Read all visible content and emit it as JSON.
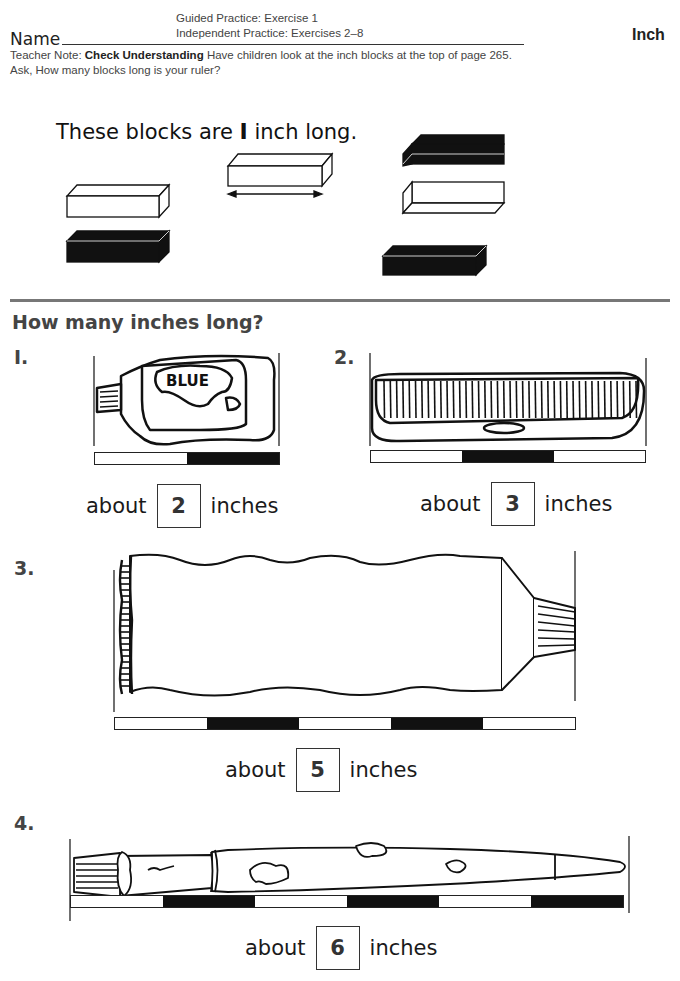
{
  "header": {
    "name_label": "Name",
    "guided_practice": "Guided Practice: Exercise 1",
    "independent_practice": "Independent Practice: Exercises 2–8",
    "topic": "Inch",
    "teacher_note_prefix": "Teacher Note:",
    "teacher_note_bold": "Check Understanding",
    "teacher_note_text": "Have children look at the inch blocks at the top of page 265. Ask, How many blocks long is your ruler?"
  },
  "intro": {
    "text_before": "These blocks are",
    "number": "I",
    "text_after": "inch long.",
    "blocks": [
      {
        "color": "white",
        "position": "left-top"
      },
      {
        "color": "black",
        "position": "left-bottom"
      },
      {
        "color": "white",
        "position": "center",
        "has_length_arrow": true
      },
      {
        "color": "black",
        "position": "right-top"
      },
      {
        "color": "white",
        "position": "right-middle"
      },
      {
        "color": "black",
        "position": "right-bottom"
      }
    ]
  },
  "section_title": "How many inches long?",
  "exercises": [
    {
      "number": "I.",
      "object": "paint tube",
      "object_label": "BLUE",
      "ruler": [
        "white",
        "black"
      ],
      "prefix": "about",
      "answer": "2",
      "unit": "inches"
    },
    {
      "number": "2.",
      "object": "comb",
      "ruler": [
        "white",
        "black",
        "white"
      ],
      "prefix": "about",
      "answer": "3",
      "unit": "inches"
    },
    {
      "number": "3.",
      "object": "toothpaste tube",
      "ruler": [
        "white",
        "black",
        "white",
        "black",
        "white"
      ],
      "prefix": "about",
      "answer": "5",
      "unit": "inches"
    },
    {
      "number": "4.",
      "object": "paintbrush",
      "ruler": [
        "white",
        "black",
        "white",
        "black",
        "white",
        "black"
      ],
      "prefix": "about",
      "answer": "6",
      "unit": "inches"
    }
  ],
  "colors": {
    "ink": "#111111",
    "heading_gray": "#444444",
    "divider": "#777777"
  }
}
